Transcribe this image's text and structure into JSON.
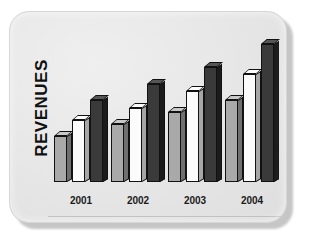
{
  "chart_data": {
    "type": "bar",
    "title": "",
    "xlabel": "",
    "ylabel": "REVENUES",
    "categories": [
      "2001",
      "2002",
      "2003",
      "2004"
    ],
    "series": [
      {
        "name": "gray",
        "color": "#a9a9a9",
        "values": [
          38,
          48,
          58,
          68
        ]
      },
      {
        "name": "white",
        "color": "#fbfbfb",
        "values": [
          52,
          62,
          76,
          90
        ]
      },
      {
        "name": "dark",
        "color": "#3a3a3a",
        "values": [
          68,
          82,
          96,
          115
        ]
      }
    ],
    "ylim": [
      0,
      125
    ],
    "grid": false,
    "legend": "none",
    "style": "3d-extruded-bars"
  },
  "chart": {
    "ylabel": "REVENUES",
    "ticks": [
      {
        "label": "2001"
      },
      {
        "label": "2002"
      },
      {
        "label": "2003"
      },
      {
        "label": "2004"
      }
    ]
  },
  "colors": {
    "card_background": "#e6e6e6",
    "page_background": "#ffffff",
    "series_gray": "#a9a9a9",
    "series_white": "#fbfbfb",
    "series_dark": "#3a3a3a",
    "outline": "#111111",
    "label_text": "#1b1b1b"
  }
}
